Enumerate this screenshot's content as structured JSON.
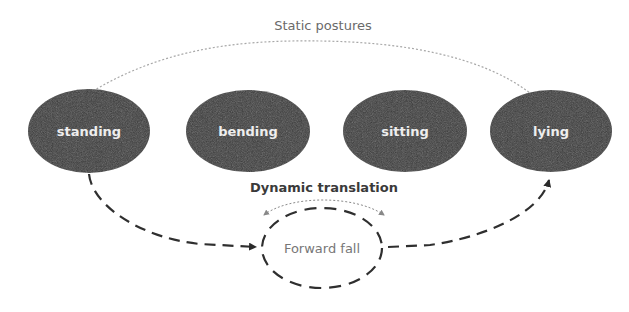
{
  "diagram": {
    "title": "Static postures",
    "dynamic_label": "Dynamic translation",
    "postures": [
      {
        "id": "standing",
        "label": "standing"
      },
      {
        "id": "bending",
        "label": "bending"
      },
      {
        "id": "sitting",
        "label": "sitting"
      },
      {
        "id": "lying",
        "label": "lying"
      }
    ],
    "transition_node": {
      "label": "Forward fall"
    },
    "edges": [
      {
        "from": "standing",
        "to": "lying",
        "style": "dotted-arc",
        "label": "Static postures"
      },
      {
        "from": "standing",
        "to": "Forward fall",
        "style": "dashed-arrow"
      },
      {
        "from": "Forward fall",
        "to": "lying",
        "style": "dashed-arrow"
      },
      {
        "from": "Forward fall",
        "to": "Forward fall",
        "style": "dotted-double-arrow",
        "label": "Dynamic translation"
      }
    ],
    "colors": {
      "node_fill": "#363636",
      "node_text": "#eeeeee",
      "dashed_line": "#333333",
      "dotted_line": "#9a9a9a",
      "title_text": "#6a6a6a"
    }
  }
}
